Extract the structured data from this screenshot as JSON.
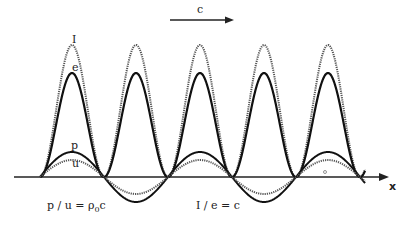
{
  "diagram": {
    "direction_label": "c",
    "axis_label": "x",
    "curve_labels": {
      "intensity": "I",
      "energy_density": "e",
      "pressure": "p",
      "velocity": "u"
    },
    "equations": {
      "impedance_lhs": "p / u = ρ",
      "impedance_sub": "0",
      "impedance_rhs": "c",
      "intensity_relation": "I / e = c"
    },
    "colors": {
      "solid": "#111111",
      "dotted": "#555555",
      "axis": "#222222"
    }
  },
  "geometry": {
    "x_start": 40,
    "x_end": 365,
    "axis_y": 177,
    "period_px": 128,
    "p_amplitude": 25,
    "u_amplitude": 17,
    "I_amplitude": 132,
    "e_amplitude": 104
  }
}
